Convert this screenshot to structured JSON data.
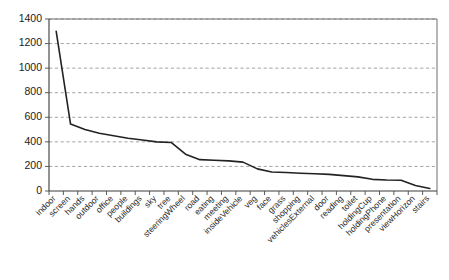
{
  "chart_data": {
    "type": "line",
    "title": "",
    "subtitle": "",
    "xlabel": "",
    "ylabel": "",
    "ylim": [
      0,
      1400
    ],
    "ytick_interval": 200,
    "yticks": [
      "0",
      "200",
      "400",
      "600",
      "800",
      "1000",
      "1200",
      "1400"
    ],
    "grid": "horizontal-dashed",
    "legend": "none",
    "line_color": "#222222",
    "grid_color": "#9a9a9a",
    "frame_color": "#6e6e6e",
    "categories": [
      "indoor",
      "screen",
      "hands",
      "outdoor",
      "office",
      "people",
      "buildings",
      "sky",
      "tree",
      "steeringWheel",
      "road",
      "eating",
      "meeting",
      "insideVehicle",
      "veg",
      "face",
      "grass",
      "shopping",
      "vehiclesExternal",
      "door",
      "reading",
      "toilet",
      "holdingCup",
      "holdingPhone",
      "presentation",
      "viewHorizon",
      "stairs"
    ],
    "values": [
      1300,
      545,
      500,
      470,
      450,
      430,
      415,
      400,
      395,
      300,
      255,
      250,
      245,
      235,
      180,
      155,
      150,
      145,
      140,
      135,
      125,
      115,
      95,
      90,
      88,
      45,
      20
    ],
    "series": [
      {
        "name": "frequency",
        "values": [
          1300,
          545,
          500,
          470,
          450,
          430,
          415,
          400,
          395,
          300,
          255,
          250,
          245,
          235,
          180,
          155,
          150,
          145,
          140,
          135,
          125,
          115,
          95,
          90,
          88,
          45,
          20
        ]
      }
    ]
  }
}
